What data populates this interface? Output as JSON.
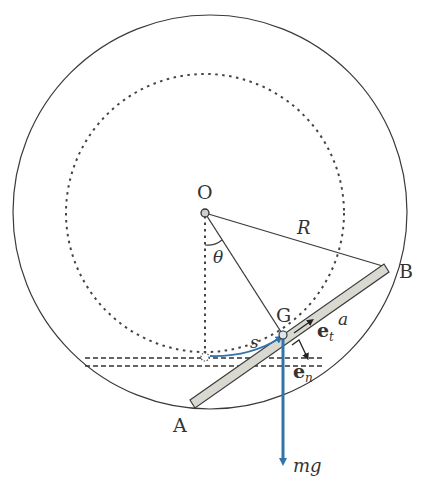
{
  "diagram": {
    "type": "mechanics-diagram",
    "labels": {
      "center": "O",
      "radius": "R",
      "angle": "θ",
      "center_of_mass": "G",
      "end_a": "A",
      "end_b": "B",
      "arc_length": "s",
      "half_length": "a",
      "tangent_vector": "e",
      "tangent_sub": "t",
      "normal_vector": "e",
      "normal_sub": "n",
      "weight": "mg"
    },
    "colors": {
      "line": "#3a3a3a",
      "rod_fill": "#d9d9d2",
      "force_arrow": "#2f74ab",
      "background": "#ffffff"
    }
  }
}
